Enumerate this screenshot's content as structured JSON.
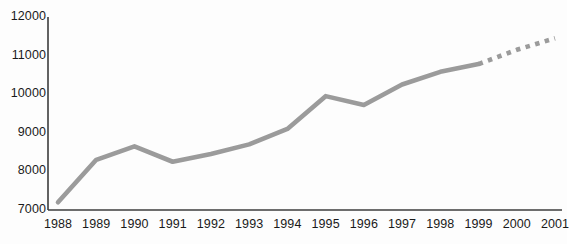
{
  "chart_data": {
    "type": "line",
    "title": "",
    "xlabel": "",
    "ylabel": "",
    "categories": [
      "1988",
      "1989",
      "1990",
      "1991",
      "1992",
      "1993",
      "1994",
      "1995",
      "1996",
      "1997",
      "1998",
      "1999",
      "2000",
      "2001"
    ],
    "values": [
      7200,
      8300,
      8650,
      8250,
      8450,
      8700,
      9100,
      9950,
      9720,
      10250,
      10580,
      10780,
      11150,
      11450
    ],
    "series": [
      {
        "name": "actual",
        "style": "solid",
        "x": [
          "1988",
          "1989",
          "1990",
          "1991",
          "1992",
          "1993",
          "1994",
          "1995",
          "1996",
          "1997",
          "1998",
          "1999"
        ],
        "values": [
          7200,
          8300,
          8650,
          8250,
          8450,
          8700,
          9100,
          9950,
          9720,
          10250,
          10580,
          10780
        ]
      },
      {
        "name": "forecast",
        "style": "dashed",
        "x": [
          "1999",
          "2000",
          "2001"
        ],
        "values": [
          10780,
          11150,
          11450
        ]
      }
    ],
    "ylim": [
      7000,
      12000
    ],
    "yticks": [
      7000,
      8000,
      9000,
      10000,
      11000,
      12000
    ],
    "ytick_labels": [
      "7000",
      "8000",
      "9000",
      "10000",
      "11000",
      "12000"
    ],
    "xtick_labels": [
      "1988",
      "1989",
      "1990",
      "1991",
      "1992",
      "1993",
      "1994",
      "1995",
      "1996",
      "1997",
      "1998",
      "1999",
      "2000",
      "2001"
    ],
    "grid": false,
    "legend": "none",
    "line_color": "#9b9b9b",
    "axis_color": "#3c3c3c",
    "text_color": "#1a1a1a"
  }
}
